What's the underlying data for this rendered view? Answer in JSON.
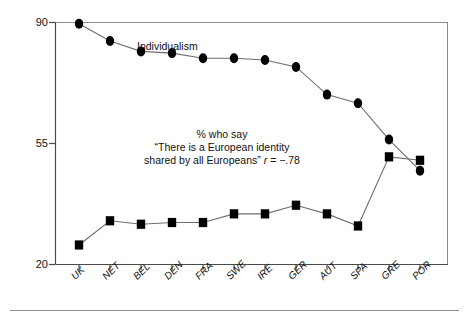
{
  "chart_data": {
    "type": "line",
    "title": "",
    "subtitle": "",
    "xlabel": "",
    "ylabel": "",
    "ylim": [
      20,
      90
    ],
    "yticks": [
      20,
      55,
      90
    ],
    "ytick_labels": [
      "20",
      "55",
      "90"
    ],
    "grid": false,
    "legend": "inline-annotations",
    "categories": [
      "UK",
      "NET",
      "BEL",
      "DEN",
      "FRA",
      "SWE",
      "IRE",
      "GER",
      "AUT",
      "SPA",
      "GRE",
      "POR"
    ],
    "series": [
      {
        "name": "Individualism",
        "marker": "circle",
        "color": "#000000",
        "values": [
          89.5,
          84.5,
          81.5,
          81.0,
          79.5,
          79.5,
          79.0,
          77.0,
          69.0,
          66.5,
          56.0,
          47.0
        ]
      },
      {
        "name": "% who say \"There is a European identity shared by all Europeans\"",
        "marker": "square",
        "color": "#000000",
        "values": [
          25.5,
          32.5,
          31.5,
          32.0,
          32.0,
          34.5,
          34.5,
          37.0,
          34.5,
          31.0,
          51.0,
          50.0
        ]
      }
    ],
    "annotations": [
      {
        "id": "series-label-individualism",
        "text": "Individualism",
        "x_px": 137,
        "y_px": 45
      },
      {
        "id": "series-label-identity-line1",
        "text": "% who say",
        "x_px": 222,
        "y_px": 133
      },
      {
        "id": "series-label-identity-line2",
        "text": "“There is a European identity",
        "x_px": 222,
        "y_px": 146
      },
      {
        "id": "series-label-identity-line3",
        "text": "shared by all Europeans”",
        "x_px": 222,
        "y_px": 159
      },
      {
        "id": "correlation-stat",
        "text": "r = −.78",
        "x_px": 222,
        "y_px": 159
      }
    ],
    "correlation": {
      "symbol": "r",
      "equals": "=",
      "value": "−.78"
    }
  },
  "axis": {
    "y_labels": [
      "90",
      "55",
      "20"
    ],
    "x_labels": [
      "UK",
      "NET",
      "BEL",
      "DEN",
      "FRA",
      "SWE",
      "IRE",
      "GER",
      "AUT",
      "SPA",
      "GRE",
      "POR"
    ]
  },
  "labels": {
    "individualism": "Individualism",
    "identity_l1": "% who say",
    "identity_l2": "“There is a European identity",
    "identity_l3": "shared by all Europeans”",
    "r_symbol": "r",
    "r_value": "= −.78"
  },
  "colors": {
    "axis": "#4a4a4a",
    "line": "#6e6e6e",
    "marker": "#000000",
    "text": "#111111",
    "rule": "#777777",
    "background": "#ffffff"
  }
}
